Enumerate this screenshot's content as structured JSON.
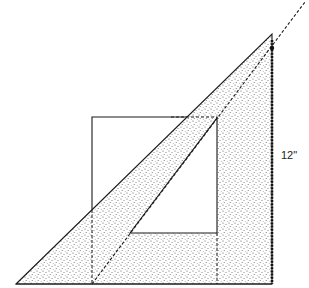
{
  "diagram": {
    "type": "technical-drawing",
    "dimension_label": "12\"",
    "colors": {
      "background": "#ffffff",
      "stroke": "#1a1a1a",
      "stipple": "#555555"
    },
    "shapes": {
      "outer_triangle": [
        [
          16,
          284
        ],
        [
          272,
          34
        ],
        [
          272,
          284
        ]
      ],
      "inner_cutout": [
        [
          130,
          233
        ],
        [
          217,
          118
        ],
        [
          217,
          233
        ]
      ],
      "square": {
        "x": 92,
        "y": 117,
        "width": 125,
        "height": 167
      },
      "dashed_diagonal": [
        [
          92,
          284
        ],
        [
          305,
          2
        ]
      ]
    }
  }
}
